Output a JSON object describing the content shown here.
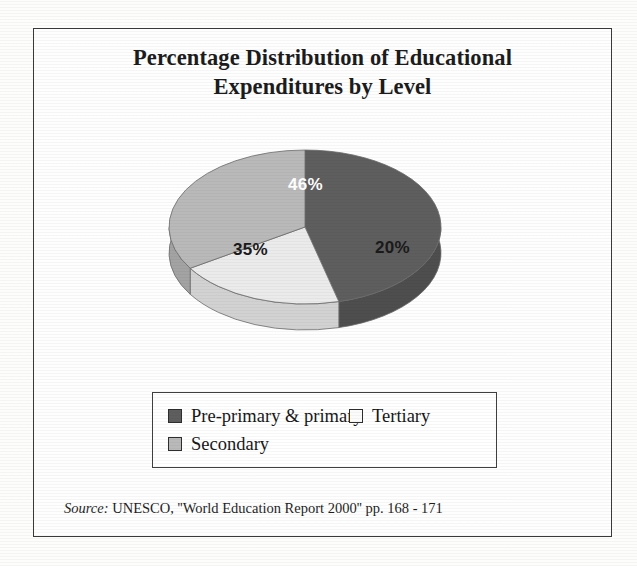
{
  "figure": {
    "title_line1": "Percentage Distribution of Educational",
    "title_line2": "Expenditures by Level",
    "source_label": "Source:",
    "source_text": "UNESCO, ''World Education Report 2000'' pp. 168 - 171"
  },
  "chart_data": {
    "type": "pie",
    "title": "Percentage Distribution of Educational Expenditures by Level",
    "xlabel": "",
    "ylabel": "",
    "categories": [
      "Pre-primary & primary",
      "Tertiary",
      "Secondary"
    ],
    "values": [
      46,
      35,
      20
    ],
    "value_labels": [
      "46%",
      "20%",
      "35%"
    ],
    "slices": [
      {
        "label": "Pre-primary & primary",
        "value": 46,
        "display": "46%",
        "color": "#5e5e5e",
        "side_color": "#4e4e4e",
        "label_color": "#ffffff",
        "start_angle_deg": 0,
        "end_angle_deg": 165.6
      },
      {
        "label": "Tertiary",
        "value": 20,
        "display": "20%",
        "color": "#ebebeb",
        "side_color": "#d2d2d2",
        "label_color": "#1a1a1a",
        "start_angle_deg": 165.6,
        "end_angle_deg": 237.6
      },
      {
        "label": "Secondary",
        "value": 35,
        "display": "35%",
        "color": "#b9b9b9",
        "side_color": "#a3a3a3",
        "label_color": "#1a1a1a",
        "start_angle_deg": 237.6,
        "end_angle_deg": 360
      }
    ],
    "legend_position": "bottom",
    "grid": false,
    "three_d": true,
    "start_angle_note": "first slice begins at 12 o'clock, drawn clockwise"
  },
  "legend": {
    "entries": [
      {
        "label": "Pre-primary & primary",
        "color": "#5e5e5e"
      },
      {
        "label": "Tertiary",
        "color": "#fbfbfb"
      },
      {
        "label": "Secondary",
        "color": "#b9b9b9"
      }
    ]
  },
  "colors": {
    "frame": "#3a3a3a",
    "text": "#1c1c1c",
    "slice_dark": "#5e5e5e",
    "slice_mid": "#b9b9b9",
    "slice_light": "#ebebeb"
  }
}
